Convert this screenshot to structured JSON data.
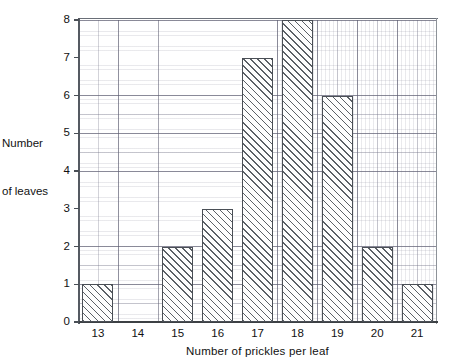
{
  "chart_data": {
    "type": "bar",
    "title": "",
    "xlabel": "Number of prickles per leaf",
    "ylabel": "Number\nof leaves",
    "ylabel_lines": [
      "Number",
      "of leaves"
    ],
    "categories": [
      "13",
      "14",
      "15",
      "16",
      "17",
      "18",
      "19",
      "20",
      "21"
    ],
    "values": [
      1,
      0,
      2,
      3,
      7,
      8,
      6,
      2,
      1
    ],
    "ylim": [
      0,
      8
    ],
    "yticks": [
      0,
      1,
      2,
      3,
      4,
      5,
      6,
      7,
      8
    ],
    "ytick_labels": [
      "0",
      "1",
      "2",
      "3",
      "4",
      "5",
      "6",
      "7",
      "8"
    ],
    "grid": true,
    "grid_style": "graph-paper",
    "legend": null,
    "legend_position": "none",
    "bar_fill": "diagonal-hatch",
    "bar_hatch_color": "#5b6066",
    "bar_border_color": "#4a4f56",
    "grid_color": "#6a6f78",
    "axis_color": "#3c4044",
    "text_color": "#111111",
    "background": "#ffffff"
  }
}
